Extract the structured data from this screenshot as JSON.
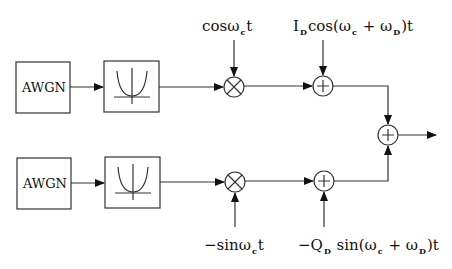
{
  "diagram": {
    "type": "block-diagram",
    "top_branch": {
      "noise_source": "AWGN",
      "filter_icon": "bandpass-filter-icon",
      "mixer_symbol": "×",
      "carrier_label": {
        "main": "cos",
        "omega": "ω",
        "sub": "c",
        "tail": "t"
      },
      "adder_symbol": "+",
      "interferer_label": {
        "prefix": "I",
        "prefix_sub": "D",
        "func": "cos(",
        "w1": "ω",
        "w1_sub": "c",
        "plus": " + ",
        "w2": "ω",
        "w2_sub": "D",
        "tail": ")t"
      }
    },
    "bottom_branch": {
      "noise_source": "AWGN",
      "filter_icon": "bandpass-filter-icon",
      "mixer_symbol": "×",
      "carrier_label": {
        "main": "−sin",
        "omega": "ω",
        "sub": "c",
        "tail": "t"
      },
      "adder_symbol": "+",
      "interferer_label": {
        "prefix": "−Q",
        "prefix_sub": "D",
        "func": " sin(",
        "w1": "ω",
        "w1_sub": "c",
        "plus": " + ",
        "w2": "ω",
        "w2_sub": "D",
        "tail": ")t"
      }
    },
    "output_adder": {
      "symbol": "+"
    },
    "colors": {
      "stroke": "#222222",
      "background": "#ffffff"
    }
  }
}
